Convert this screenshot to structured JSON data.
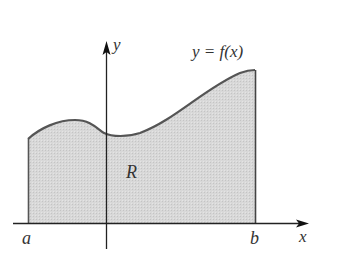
{
  "diagram": {
    "type": "area-under-curve",
    "labels": {
      "y_axis": "y",
      "x_axis": "x",
      "curve": "y = f(x)",
      "region": "R",
      "left_bound": "a",
      "right_bound": "b"
    },
    "colors": {
      "region_fill": "#d6d6d6",
      "curve_stroke": "#555555",
      "axis_stroke": "#222222",
      "label_text": "#333333"
    }
  }
}
